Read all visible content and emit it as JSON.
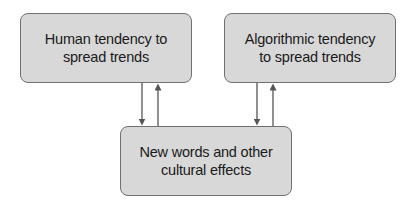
{
  "diagram": {
    "type": "flow",
    "nodes": [
      {
        "id": "human",
        "label": "Human tendency to\nspread trends"
      },
      {
        "id": "algo",
        "label": "Algorithmic tendency\nto spread trends"
      },
      {
        "id": "words",
        "label": "New words and other\ncultural effects"
      }
    ],
    "edges": [
      {
        "from": "human",
        "to": "words",
        "direction": "down"
      },
      {
        "from": "words",
        "to": "human",
        "direction": "up"
      },
      {
        "from": "algo",
        "to": "words",
        "direction": "down"
      },
      {
        "from": "words",
        "to": "algo",
        "direction": "up"
      }
    ],
    "colors": {
      "box_fill": "#d8d8d8",
      "box_border": "#707070",
      "arrow": "#555555",
      "text": "#1a1a1a",
      "background": "#ffffff"
    }
  }
}
